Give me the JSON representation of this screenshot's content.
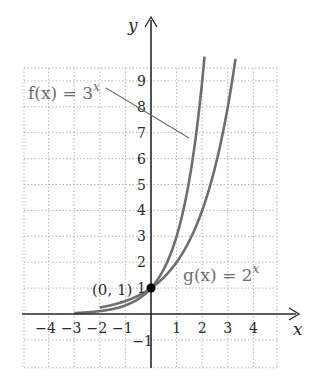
{
  "chart_data": {
    "type": "line",
    "title": "",
    "xlabel": "x",
    "ylabel": "y",
    "xlim": [
      -5,
      5
    ],
    "ylim": [
      -2,
      10
    ],
    "grid": true,
    "grid_style": "dotted",
    "x_ticks": [
      -4,
      -3,
      -2,
      -1,
      1,
      2,
      3,
      4
    ],
    "x_tick_labels": [
      "−4",
      "−3",
      "−2",
      "−1",
      "1",
      "2",
      "3",
      "4"
    ],
    "y_ticks": [
      -1,
      1,
      2,
      3,
      4,
      5,
      6,
      7,
      8,
      9
    ],
    "y_tick_labels": [
      "−1",
      "1",
      "2",
      "3",
      "4",
      "5",
      "6",
      "7",
      "8",
      "9"
    ],
    "series": [
      {
        "name": "f(x) = 3^x",
        "label_main": "f(x) = 3",
        "label_exp": "x",
        "base": 3,
        "domain": [
          -3,
          2.09
        ],
        "x": [
          -3,
          -2,
          -1,
          0,
          1,
          2
        ],
        "values": [
          0.037,
          0.111,
          0.333,
          1,
          3,
          9
        ],
        "color": "#6e6e6e"
      },
      {
        "name": "g(x) = 2^x",
        "label_main": "g(x) = 2",
        "label_exp": "x",
        "base": 2,
        "domain": [
          -2,
          3.3
        ],
        "x": [
          -2,
          -1,
          0,
          1,
          2,
          3
        ],
        "values": [
          0.25,
          0.5,
          1,
          2,
          4,
          8
        ],
        "color": "#6e6e6e"
      }
    ],
    "annotations": [
      {
        "text": "(0, 1)",
        "x": 0,
        "y": 1,
        "marker": "filled-circle"
      }
    ]
  },
  "labels": {
    "x_axis": "x",
    "y_axis": "y",
    "point": "(0, 1)",
    "f_main": "f(x) = 3",
    "f_exp": "x",
    "g_main": "g(x) = 2",
    "g_exp": "x"
  },
  "colors": {
    "axis": "#2a2a2a",
    "curve": "#6e6e6e",
    "grid": "#b5b5b5",
    "point": "#000000"
  }
}
